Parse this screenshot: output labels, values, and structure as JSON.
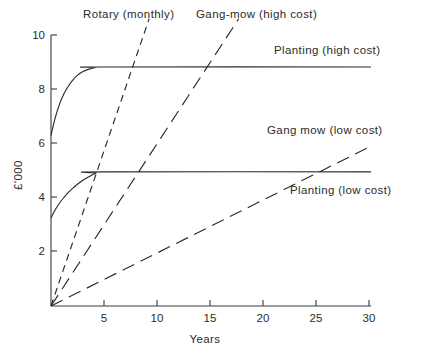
{
  "chart_data": {
    "type": "line",
    "title": "",
    "xlabel": "Years",
    "ylabel": "£'000",
    "xlim": [
      0,
      30
    ],
    "ylim": [
      0,
      10
    ],
    "xticks": [
      "5",
      "10",
      "15",
      "20",
      "25",
      "30"
    ],
    "xtick_values": [
      5,
      10,
      15,
      20,
      25,
      30
    ],
    "yticks": [
      "2",
      "4",
      "6",
      "8",
      "10"
    ],
    "ytick_values": [
      2,
      4,
      6,
      8,
      10
    ],
    "grid": false,
    "legend_position": "inline-annotations",
    "series": [
      {
        "name": "Planting (high cost)",
        "style": "solid-curve",
        "label_x": 30,
        "label_y": 9.6,
        "points": [
          [
            0,
            6.3
          ],
          [
            0.4,
            6.95
          ],
          [
            0.8,
            7.45
          ],
          [
            1.2,
            7.82
          ],
          [
            1.6,
            8.1
          ],
          [
            2.0,
            8.32
          ],
          [
            2.5,
            8.52
          ],
          [
            3.0,
            8.65
          ],
          [
            3.5,
            8.73
          ],
          [
            4.2,
            8.8
          ],
          [
            4.8,
            8.82
          ],
          [
            30,
            8.82
          ]
        ]
      },
      {
        "name": "Planting (low cost)",
        "style": "solid-curve",
        "label_x": 30,
        "label_y": 4.1,
        "points": [
          [
            0,
            3.25
          ],
          [
            0.4,
            3.55
          ],
          [
            0.8,
            3.8
          ],
          [
            1.2,
            4.0
          ],
          [
            1.6,
            4.18
          ],
          [
            2.0,
            4.33
          ],
          [
            2.5,
            4.5
          ],
          [
            3.0,
            4.64
          ],
          [
            3.5,
            4.76
          ],
          [
            4.2,
            4.9
          ],
          [
            4.9,
            4.95
          ],
          [
            30,
            4.95
          ]
        ]
      },
      {
        "name": "Rotary (monthly)",
        "style": "dashed-short",
        "label_x": 6.5,
        "label_y": 10.4,
        "points": [
          [
            0,
            0
          ],
          [
            9.2,
            10.6
          ]
        ]
      },
      {
        "name": "Gang-mow (high cost)",
        "style": "dashed-long",
        "label_x": 19.5,
        "label_y": 10.4,
        "points": [
          [
            0,
            0
          ],
          [
            17.6,
            10.6
          ]
        ]
      },
      {
        "name": "Gang mow (low cost)",
        "style": "dashed-long",
        "label_x": 30,
        "label_y": 6.9,
        "points": [
          [
            0,
            0
          ],
          [
            30,
            5.9
          ]
        ]
      }
    ],
    "annotations": [
      {
        "text": "Rotary (monthly)",
        "series": "Rotary (monthly)"
      },
      {
        "text": "Gang-mow (high cost)",
        "series": "Gang-mow (high cost)"
      },
      {
        "text": "Planting (high cost)",
        "series": "Planting (high cost)"
      },
      {
        "text": "Gang mow (low cost)",
        "series": "Gang mow (low cost)"
      },
      {
        "text": "Planting (low cost)",
        "series": "Planting (low cost)"
      }
    ]
  },
  "labels": {
    "y_axis_title": "£'000",
    "x_axis_title": "Years",
    "rotary_monthly": "Rotary (monthly)",
    "gang_mow_high": "Gang-mow (high cost)",
    "planting_high": "Planting (high cost)",
    "gang_mow_low": "Gang mow (low cost)",
    "planting_low": "Planting (low cost)",
    "y_tick_10": "10",
    "y_tick_8": "8",
    "y_tick_6": "6",
    "y_tick_4": "4",
    "y_tick_2": "2",
    "x_tick_5": "5",
    "x_tick_10": "10",
    "x_tick_15": "15",
    "x_tick_20": "20",
    "x_tick_25": "25",
    "x_tick_30": "30"
  },
  "colors": {
    "line": "#2b2b2b",
    "axis": "#3a3a3a",
    "background": "#ffffff"
  }
}
